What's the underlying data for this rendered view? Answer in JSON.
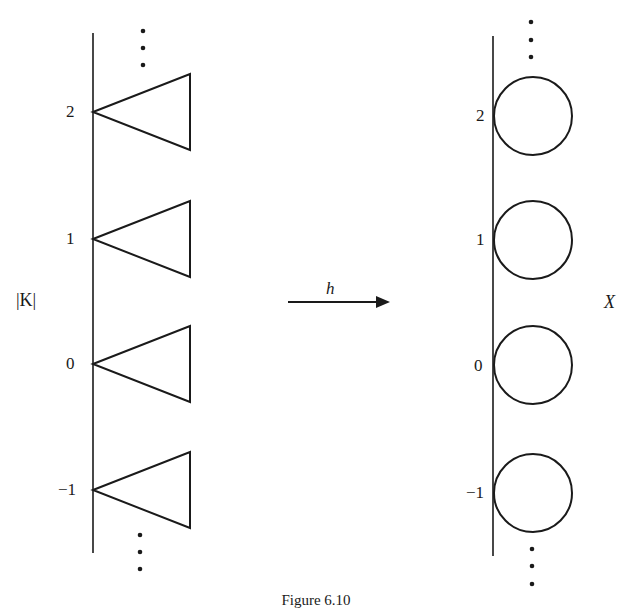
{
  "figure": {
    "caption": "Figure 6.10",
    "left_space": {
      "label_prefix": "|",
      "label_main": "K",
      "label_suffix": "|",
      "shape": "triangle"
    },
    "right_space": {
      "label": "X",
      "shape": "circle"
    },
    "map": {
      "label": "h",
      "direction": "left-to-right"
    },
    "levels": [
      {
        "index": "2",
        "left_y": 112,
        "right_y": 116
      },
      {
        "index": "1",
        "left_y": 239,
        "right_y": 240
      },
      {
        "index": "0",
        "left_y": 364,
        "right_y": 365
      },
      {
        "index": "−1",
        "left_y": 490,
        "right_y": 493
      }
    ],
    "ellipsis": "⋮",
    "colors": {
      "stroke": "#1a1a1a",
      "background": "#ffffff"
    }
  }
}
